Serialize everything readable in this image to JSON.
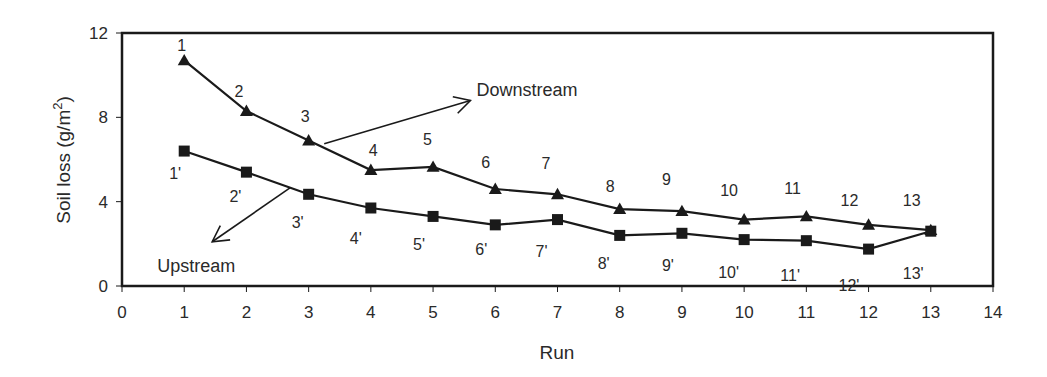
{
  "chart_data": {
    "type": "line",
    "title": "",
    "xlabel": "Run",
    "ylabel": "Soil loss (g/m",
    "ylabel_sup": "2",
    "ylabel_close": ")",
    "xlim": [
      0,
      14
    ],
    "ylim": [
      0,
      12
    ],
    "xticks": [
      0,
      1,
      2,
      3,
      4,
      5,
      6,
      7,
      8,
      9,
      10,
      11,
      12,
      13,
      14
    ],
    "yticks": [
      0,
      4,
      8,
      12
    ],
    "grid": false,
    "legend": "none (inline arrow annotations)",
    "x": [
      1,
      2,
      3,
      4,
      5,
      6,
      7,
      8,
      9,
      10,
      11,
      12,
      13
    ],
    "series": [
      {
        "name": "Downstream",
        "marker": "triangle",
        "values": [
          10.7,
          8.3,
          6.9,
          5.5,
          5.65,
          4.6,
          4.35,
          3.65,
          3.55,
          3.15,
          3.3,
          2.9,
          2.65
        ],
        "point_labels": [
          "1",
          "2",
          "3",
          "4",
          "5",
          "6",
          "7",
          "8",
          "9",
          "10",
          "11",
          "12",
          "13"
        ]
      },
      {
        "name": "Upstream",
        "marker": "square",
        "values": [
          6.4,
          5.4,
          4.35,
          3.7,
          3.3,
          2.9,
          3.15,
          2.4,
          2.5,
          2.2,
          2.15,
          1.75,
          2.6
        ],
        "point_labels": [
          "1'",
          "2'",
          "3'",
          "4'",
          "5'",
          "6'",
          "7'",
          "8'",
          "9'",
          "10'",
          "11'",
          "12'",
          "13'"
        ]
      }
    ],
    "annotations": [
      {
        "text": "Downstream",
        "arrow_from": [
          3.25,
          6.75
        ],
        "arrow_to": [
          5.6,
          8.8
        ]
      },
      {
        "text": "Upstream",
        "arrow_from": [
          2.7,
          4.65
        ],
        "arrow_to": [
          1.45,
          2.1
        ]
      }
    ]
  },
  "colors": {
    "line": "#1a1a1a",
    "text": "#2a2a2a",
    "background": "#ffffff"
  }
}
